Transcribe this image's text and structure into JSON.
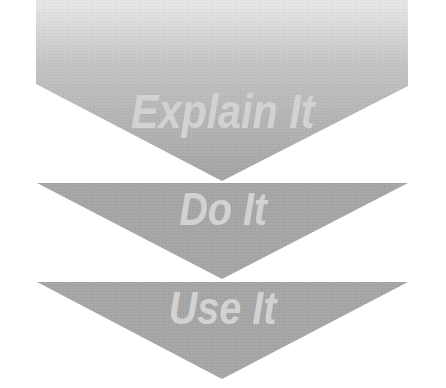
{
  "diagram": {
    "type": "stacked-chevron-steps",
    "colors": {
      "background": "#ffffff",
      "step1_gradient_top": "#e6e6e6",
      "step1_gradient_bottom": "#a6a6a6",
      "step_fill": "#a6a6a6",
      "label_text": "#d2d2d2"
    },
    "steps": [
      {
        "label": "Explain It"
      },
      {
        "label": "Do It"
      },
      {
        "label": "Use It"
      }
    ]
  }
}
